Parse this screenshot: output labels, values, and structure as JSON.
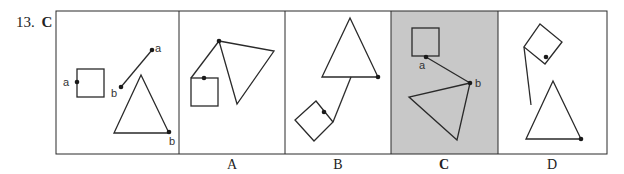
{
  "question": {
    "number": "13.",
    "answer": "C"
  },
  "panels": [
    {
      "id": "question",
      "label": "",
      "highlighted": false
    },
    {
      "id": "A",
      "label": "A",
      "highlighted": false
    },
    {
      "id": "B",
      "label": "B",
      "highlighted": false
    },
    {
      "id": "C",
      "label": "C",
      "highlighted": true
    },
    {
      "id": "D",
      "label": "D",
      "highlighted": false
    }
  ],
  "point_labels": {
    "a": "a",
    "b": "b"
  },
  "colors": {
    "stroke": "#2a2a2a",
    "highlight": "#c8c8c8",
    "background": "#ffffff"
  }
}
